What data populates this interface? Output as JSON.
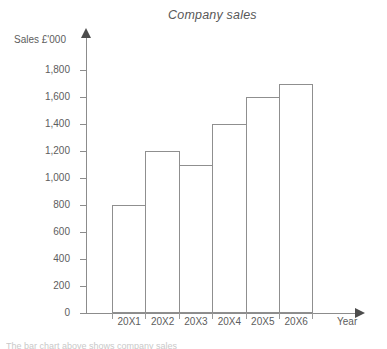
{
  "chart_data": {
    "type": "bar",
    "title": "Company sales",
    "xlabel": "Year",
    "ylabel": "Sales £'000",
    "categories": [
      "20X1",
      "20X2",
      "20X3",
      "20X4",
      "20X5",
      "20X6"
    ],
    "values": [
      800,
      1200,
      1100,
      1400,
      1600,
      1700
    ],
    "ylim": [
      0,
      1800
    ],
    "ytick_values": [
      0,
      200,
      400,
      600,
      800,
      1000,
      1200,
      1400,
      1600,
      1800
    ],
    "ytick_labels": [
      "0",
      "200",
      "400",
      "600",
      "800",
      "1,000",
      "1,200",
      "1,400",
      "1,600",
      "1,800"
    ],
    "grid": false,
    "legend": null,
    "bar_fill_color": "#ffffff",
    "bar_outline_color": "#8f8f8f",
    "axis_color": "#8c8c8c",
    "text_color": "#5d5d5d"
  },
  "footer": {
    "clipped_text": "The bar chart above shows company sales"
  }
}
